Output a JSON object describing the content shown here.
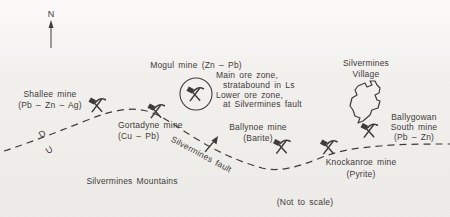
{
  "canvas": {
    "background": "#f1efec",
    "ink": "#3e3b38"
  },
  "compass": {
    "north_label": "N"
  },
  "labels": {
    "mountains": "Silvermines Mountains",
    "not_to_scale": "(Not to scale)",
    "fault": "Silvermines fault",
    "fault_downthrow": "D",
    "fault_upthrow": "U"
  },
  "village": {
    "line1": "Silvermines",
    "line2": "Village"
  },
  "mines": {
    "shallee": {
      "name": "Shallee mine",
      "minerals": "(Pb – Zn – Ag)"
    },
    "gortadyne": {
      "name": "Gortadyne mine",
      "minerals": "(Cu – Pb)"
    },
    "mogul": {
      "name": "Mogul mine (Zn – Pb)",
      "note_line1": "Main ore zone,",
      "note_line2": "stratabound in Ls",
      "note_line3": "Lower ore zone,",
      "note_line4": "at Silvermines fault"
    },
    "ballynoe": {
      "name": "Ballynoe mine",
      "minerals": "(Barite)"
    },
    "knockanroe": {
      "name": "Knockanroe mine",
      "minerals": "(Pyrite)"
    },
    "ballygowan": {
      "name_line1": "Ballygowan",
      "name_line2": "South mine",
      "minerals": "(Pb – Zn)"
    }
  }
}
